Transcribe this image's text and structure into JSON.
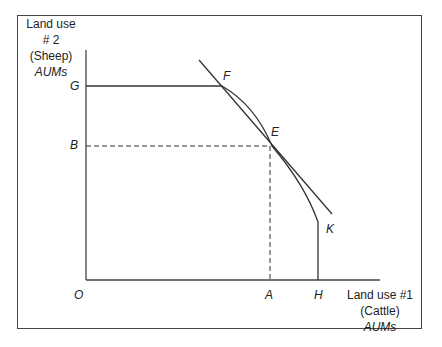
{
  "diagram": {
    "type": "production possibility frontier",
    "y_axis_label": {
      "line1": "Land use",
      "line2": "# 2",
      "line3": "(Sheep)",
      "line4": "AUMs"
    },
    "x_axis_label": {
      "line1": "Land use #1",
      "line2": "(Cattle)",
      "line3": "AUMs"
    },
    "points": {
      "origin": "O",
      "G": "G",
      "B": "B",
      "F": "F",
      "E": "E",
      "K": "K",
      "A": "A",
      "H": "H"
    },
    "colors": {
      "line": "#333333",
      "frame": "#444444",
      "background": "#ffffff"
    }
  }
}
